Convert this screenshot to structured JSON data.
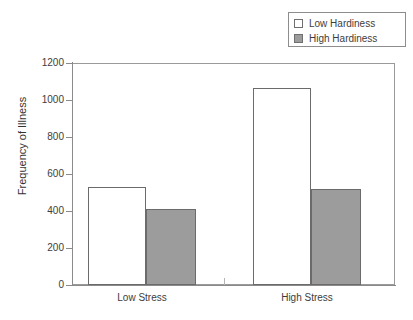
{
  "chart_data": {
    "type": "bar",
    "title": "",
    "xlabel": "",
    "ylabel": "Frequency of Illness",
    "categories": [
      "Low Stress",
      "High Stress"
    ],
    "series": [
      {
        "name": "Low Hardiness",
        "values": [
          530,
          1065
        ],
        "color": "#ffffff"
      },
      {
        "name": "High Hardiness",
        "values": [
          412,
          518
        ],
        "color": "#9c9c9c"
      }
    ],
    "ylim": [
      0,
      1200
    ],
    "yticks": [
      0,
      200,
      400,
      600,
      800,
      1000,
      1200
    ],
    "ytick_labels": [
      "0",
      "200",
      "400",
      "600",
      "800",
      "1000",
      "1200"
    ],
    "grid": false,
    "legend_position": "top-right"
  },
  "axis": {
    "y_title": "Frequency of Illness",
    "ticks": [
      {
        "label": "1200",
        "value": 1200
      },
      {
        "label": "1000",
        "value": 1000
      },
      {
        "label": "800",
        "value": 800
      },
      {
        "label": "600",
        "value": 600
      },
      {
        "label": "400",
        "value": 400
      },
      {
        "label": "200",
        "value": 200
      },
      {
        "label": "0",
        "value": 0
      }
    ]
  },
  "legend": {
    "entries": [
      {
        "label": "Low Hardiness",
        "swatch": "legend-swatch-low-hardiness"
      },
      {
        "label": "High Hardiness",
        "swatch": "legend-swatch-high-hardiness"
      }
    ]
  },
  "x_categories": [
    {
      "label": "Low Stress"
    },
    {
      "label": "High Stress"
    }
  ],
  "bars": [
    {
      "group": "Low Stress",
      "series": "Low Hardiness",
      "value": 530
    },
    {
      "group": "Low Stress",
      "series": "High Hardiness",
      "value": 412
    },
    {
      "group": "High Stress",
      "series": "Low Hardiness",
      "value": 1065
    },
    {
      "group": "High Stress",
      "series": "High Hardiness",
      "value": 518
    }
  ],
  "colors": {
    "low_hardiness_fill": "#ffffff",
    "high_hardiness_fill": "#9c9c9c",
    "bar_outline": "#6b6b6b",
    "axis": "#8a8a8a",
    "text": "#3d3d3d",
    "background": "#ffffff"
  }
}
